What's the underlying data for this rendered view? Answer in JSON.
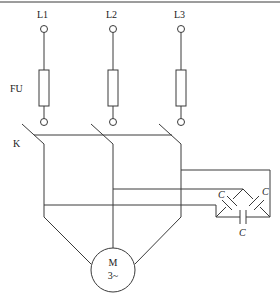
{
  "diagram": {
    "type": "circuit-schematic",
    "phases": [
      {
        "label": "L1"
      },
      {
        "label": "L2"
      },
      {
        "label": "L3"
      }
    ],
    "fuse_label": "FU",
    "switch_label": "K",
    "motor": {
      "label_line1": "M",
      "label_line2": "3~"
    },
    "capacitors": [
      {
        "label": "C"
      },
      {
        "label": "C"
      },
      {
        "label": "C"
      }
    ],
    "colors": {
      "line": "#3a3a3a",
      "background": "#ffffff"
    }
  }
}
